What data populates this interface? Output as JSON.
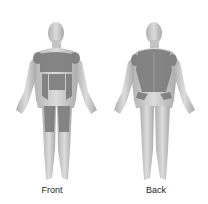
{
  "diagram": {
    "type": "body-map",
    "figures": [
      {
        "id": "front",
        "label": "Front"
      },
      {
        "id": "back",
        "label": "Back"
      }
    ],
    "colors": {
      "skin": "#d3d3d3",
      "skin_shadow": "#a9a9a9",
      "muscle": "#7c7c7c",
      "background": "#ffffff"
    }
  }
}
